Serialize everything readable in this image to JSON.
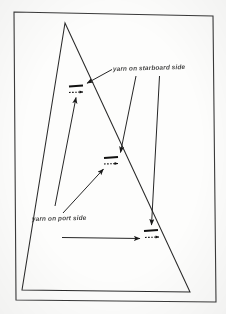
{
  "diagram": {
    "background_color": "#fdfdfc",
    "ink_color": "#1a1a1a",
    "labels": {
      "starboard": "yarn on starboard side",
      "port": "yarn on port side"
    },
    "border": {
      "name": "page-border-rectangle",
      "points": "14,12 213,16 216,302 16,300"
    },
    "sail": {
      "name": "sail-triangle-outline",
      "points": "65,23 190,292 22,290",
      "head_point": "65,23",
      "clew_point": "190,292",
      "tack_point": "22,290"
    },
    "tufts": [
      {
        "name": "yarn-tuft-upper",
        "bar_x1": 69,
        "bar_y1": 86.5,
        "bar_x2": 83,
        "bar_y2": 85.5,
        "tail_x1": 69,
        "tail_y1": 92.5,
        "tail_x2": 83,
        "tail_y2": 92
      },
      {
        "name": "yarn-tuft-middle",
        "bar_x1": 104,
        "bar_y1": 158,
        "bar_x2": 118,
        "bar_y2": 157,
        "tail_x1": 104,
        "tail_y1": 164,
        "tail_x2": 118,
        "tail_y2": 163.5
      },
      {
        "name": "yarn-tuft-lower",
        "bar_x1": 144,
        "bar_y1": 231,
        "bar_x2": 158,
        "bar_y2": 230,
        "tail_x1": 145,
        "tail_y1": 237.5,
        "tail_x2": 159,
        "tail_y2": 237
      }
    ],
    "starboard_leaders": [
      {
        "name": "leader-starboard-to-upper-tuft",
        "x1": 112,
        "y1": 69,
        "x2": 86,
        "y2": 83
      },
      {
        "name": "leader-starboard-to-middle-tuft",
        "x1": 136,
        "y1": 76,
        "x2": 120,
        "y2": 152
      },
      {
        "name": "leader-starboard-to-lower-tuft",
        "x1": 159,
        "y1": 76,
        "x2": 151,
        "y2": 225
      }
    ],
    "port_leaders": [
      {
        "name": "leader-port-to-upper-tuft",
        "x1": 55,
        "y1": 205,
        "x2": 76,
        "y2": 97
      },
      {
        "name": "leader-port-to-middle-tuft",
        "x1": 63,
        "y1": 213,
        "x2": 103,
        "y2": 169
      },
      {
        "name": "leader-port-to-lower-tuft",
        "x1": 62,
        "y1": 237,
        "x2": 140,
        "y2": 238
      }
    ]
  }
}
